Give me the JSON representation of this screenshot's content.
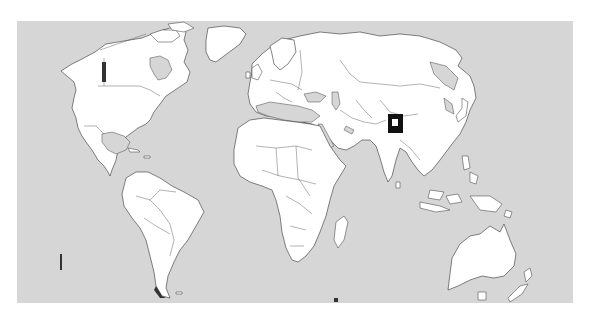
{
  "map": {
    "type": "world-political-outline",
    "projection": "equirectangular-like",
    "colors": {
      "ocean": "#d6d6d6",
      "land": "#ffffff",
      "border": "#333333",
      "marker": "#111111",
      "marker_symbol": "#ffffff"
    },
    "marker": {
      "icon": "square-location-marker",
      "region": "northern India",
      "x": 388,
      "y": 114,
      "width": 15,
      "height": 19
    }
  }
}
